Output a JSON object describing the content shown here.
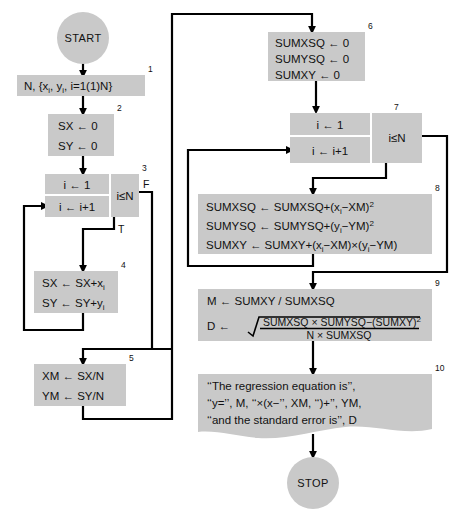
{
  "figure": {
    "type": "flowchart",
    "palette": {
      "box_fill": "#c9c9c9",
      "line": "#000000",
      "background": "#ffffff"
    }
  },
  "terminals": {
    "start": "START",
    "stop": "STOP"
  },
  "boxes": {
    "b1": {
      "number": "1",
      "lines": [
        "N,  {x",
        "i",
        ",  y",
        "i",
        ",  i=1(1)N}"
      ],
      "text": "N, {xi, yi, i=1(1)N}"
    },
    "b2": {
      "number": "2",
      "line1": "SX  ←  0",
      "line2": "SY  ←  0"
    },
    "b3": {
      "number": "3",
      "init": "i  ←  1",
      "incr": "i  ←  i+1",
      "cond": "i≤N",
      "true_label": "T",
      "false_label": "F"
    },
    "b4": {
      "number": "4",
      "line1": "SX  ←  SX+x",
      "line1sub": "i",
      "line2": "SY  ←  SY+y",
      "line2sub": "i"
    },
    "b5": {
      "number": "5",
      "line1": "XM  ←  SX/N",
      "line2": "YM  ←  SY/N"
    },
    "b6": {
      "number": "6",
      "line1": "SUMXSQ  ←  0",
      "line2": "SUMYSQ  ←  0",
      "line3": "SUMXY  ←  0"
    },
    "b7": {
      "number": "7",
      "init": "i  ←  1",
      "incr": "i  ←  i+1",
      "cond": "i≤N"
    },
    "b8": {
      "number": "8",
      "line1a": "SUMXSQ  ←  SUMXSQ+(x",
      "line1b": "i",
      "line1c": "−XM)",
      "line1d": "2",
      "line2a": "SUMYSQ  ←  SUMYSQ+(y",
      "line2b": "i",
      "line2c": "−YM)",
      "line2d": "2",
      "line3a": "SUMXY  ←  SUMXY+(x",
      "line3b": "i",
      "line3c": "−XM)×(y",
      "line3d": "i",
      "line3e": "−YM)"
    },
    "b9": {
      "number": "9",
      "line1": "M  ←  SUMXY / SUMXSQ",
      "d_label": "D  ←",
      "numerator_a": "SUMXSQ × SUMYSQ−(SUMXY)",
      "numerator_sup": "2",
      "denominator": "N × SUMXSQ"
    },
    "b10": {
      "number": "10",
      "line1": "‘‘The regression equation is’’,",
      "line2": "‘‘y=’’,  M,  ‘‘×(x−’’,  XM,  ‘‘)+’’,  YM,",
      "line3": "‘‘and the standard error is’’,  D"
    }
  }
}
